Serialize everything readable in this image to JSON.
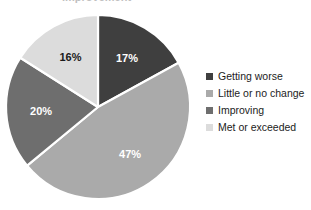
{
  "title_fragment": "improvement",
  "background_color": "#ffffff",
  "chart_data": {
    "type": "pie",
    "title": "",
    "xlabel": "",
    "ylabel": "",
    "legend_position": "right",
    "grid": false,
    "start_angle_deg": 0,
    "direction": "clockwise",
    "categories": [
      "Getting worse",
      "Little or no change",
      "Improving",
      "Met or exceeded"
    ],
    "values": [
      17,
      47,
      20,
      16
    ],
    "value_unit": "%",
    "data_labels": [
      "17%",
      "47%",
      "20%",
      "16%"
    ],
    "colors": [
      "#3f3f3f",
      "#aaaaaa",
      "#6e6e6e",
      "#dcdcdc"
    ],
    "label_text_colors": [
      "#ffffff",
      "#ffffff",
      "#ffffff",
      "#1a1a1a"
    ],
    "slice_separator_color": "#ffffff",
    "center": {
      "x": 98,
      "y": 107
    },
    "radius": 92
  },
  "legend": {
    "items": [
      {
        "label": "Getting worse",
        "color": "#3f3f3f",
        "swatch": "square-swatch"
      },
      {
        "label": "Little or no change",
        "color": "#aaaaaa",
        "swatch": "square-swatch"
      },
      {
        "label": "Improving",
        "color": "#6e6e6e",
        "swatch": "square-swatch"
      },
      {
        "label": "Met or exceeded",
        "color": "#dcdcdc",
        "swatch": "square-swatch"
      }
    ]
  }
}
